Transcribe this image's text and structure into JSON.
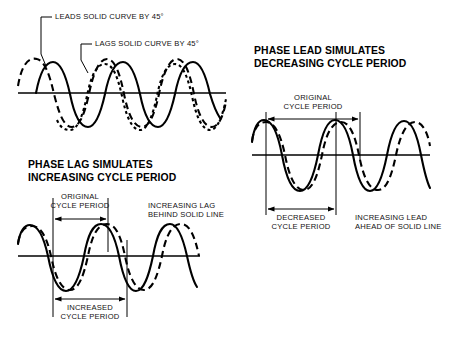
{
  "figure": {
    "title_top_left_callouts": [
      {
        "id": "leads",
        "text": "LEADS SOLID CURVE BY 45°"
      },
      {
        "id": "lags",
        "text": "LAGS SOLID CURVE BY 45°"
      }
    ],
    "panels": [
      {
        "id": "top-reference",
        "heading_line1": "",
        "heading_line2": "",
        "curves": [
          {
            "style": "dashed",
            "role": "leads-solid-by-45-degrees"
          },
          {
            "style": "solid",
            "role": "reference"
          },
          {
            "style": "dotted",
            "role": "lags-solid-by-45-degrees"
          }
        ]
      },
      {
        "id": "phase-lag",
        "heading_line1": "PHASE LAG SIMULATES",
        "heading_line2": "INCREASING CYCLE PERIOD",
        "dim_original_line1": "ORIGINAL",
        "dim_original_line2": "CYCLE PERIOD",
        "note_line1": "INCREASING LAG",
        "note_line2": "BEHIND SOLID LINE",
        "dim_result_line1": "INCREASED",
        "dim_result_line2": "CYCLE PERIOD"
      },
      {
        "id": "phase-lead",
        "heading_line1": "PHASE LEAD SIMULATES",
        "heading_line2": "DECREASING CYCLE PERIOD",
        "dim_original_line1": "ORIGINAL",
        "dim_original_line2": "CYCLE PERIOD",
        "note_line1": "INCREASING LEAD",
        "note_line2": "AHEAD OF SOLID LINE",
        "dim_result_line1": "DECREASED",
        "dim_result_line2": "CYCLE PERIOD"
      }
    ],
    "colors": {
      "ink": "#000000",
      "background": "#ffffff"
    }
  }
}
